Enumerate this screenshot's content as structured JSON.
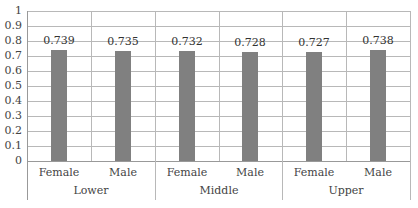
{
  "chart_data": {
    "type": "bar",
    "title": "",
    "xlabel": "",
    "ylabel": "",
    "ylim": [
      0,
      1
    ],
    "yticks": [
      "0",
      "0.1",
      "0.2",
      "0.3",
      "0.4",
      "0.5",
      "0.6",
      "0.7",
      "0.8",
      "0.9",
      "1"
    ],
    "grid": true,
    "legend": "none",
    "groups": [
      "Lower",
      "Middle",
      "Upper"
    ],
    "categories": [
      "Female",
      "Male",
      "Female",
      "Male",
      "Female",
      "Male"
    ],
    "values": [
      0.739,
      0.735,
      0.732,
      0.728,
      0.727,
      0.738
    ],
    "value_labels": [
      "0.739",
      "0.735",
      "0.732",
      "0.728",
      "0.727",
      "0.738"
    ],
    "bar_color": "#808080"
  }
}
